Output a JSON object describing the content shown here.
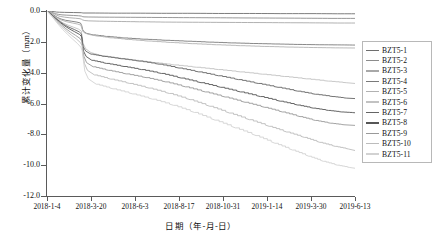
{
  "chart_data": {
    "type": "line",
    "title": "",
    "xlabel": "日期（年-月-日）",
    "ylabel": "累计变化量（mm）",
    "xlim": [
      0,
      7
    ],
    "ylim": [
      -12.0,
      0.0
    ],
    "grid": false,
    "legend_position": "right",
    "xtick_labels": [
      "2018-1-4",
      "2018-3-20",
      "2018-6-3",
      "2018-8-17",
      "2018-10-31",
      "2019-1-14",
      "2019-3-30",
      "2019-6-13"
    ],
    "ytick_labels": [
      "0.0",
      "-2.0",
      "-4.0",
      "-6.0",
      "-8.0",
      "-10.0",
      "-12.0"
    ],
    "ytick_values": [
      0.0,
      -2.0,
      -4.0,
      -6.0,
      -8.0,
      -10.0,
      -12.0
    ],
    "x_unit_note": "x positions are fractional tick index (0 = 2018-1-4, 7 = 2019-6-13)",
    "series": [
      {
        "name": "BZT5-1",
        "color": "#6e6e6e",
        "x": [
          0.0,
          0.1,
          0.18,
          0.22,
          0.28,
          0.4,
          0.6,
          0.78,
          0.8,
          0.82,
          1.0,
          1.5,
          2.0,
          2.6,
          3.2,
          3.9,
          4.6,
          5.3,
          6.0,
          6.6,
          7.0
        ],
        "y": [
          0.0,
          -0.02,
          -0.05,
          -0.07,
          -0.08,
          -0.09,
          -0.1,
          -0.11,
          -0.12,
          -0.13,
          -0.13,
          -0.14,
          -0.14,
          -0.15,
          -0.15,
          -0.16,
          -0.16,
          -0.17,
          -0.17,
          -0.18,
          -0.18
        ]
      },
      {
        "name": "BZT5-2",
        "color": "#8c8c8c",
        "x": [
          0.0,
          0.08,
          0.15,
          0.2,
          0.26,
          0.34,
          0.45,
          0.6,
          0.72,
          0.78,
          0.8,
          0.84,
          0.95,
          1.3,
          1.9,
          2.5,
          3.1,
          3.8,
          4.5,
          5.2,
          5.9,
          6.5,
          7.0
        ],
        "y": [
          0.0,
          -0.05,
          -0.12,
          -0.18,
          -0.22,
          -0.25,
          -0.27,
          -0.29,
          -0.31,
          -0.33,
          -0.36,
          -0.38,
          -0.39,
          -0.4,
          -0.41,
          -0.42,
          -0.43,
          -0.44,
          -0.45,
          -0.46,
          -0.47,
          -0.48,
          -0.48
        ]
      },
      {
        "name": "BZT5-3",
        "color": "#a8a8a8",
        "x": [
          0.0,
          0.08,
          0.16,
          0.22,
          0.3,
          0.4,
          0.52,
          0.65,
          0.75,
          0.79,
          0.81,
          0.86,
          0.95,
          1.2,
          1.6,
          2.1,
          2.7,
          3.3,
          4.0,
          4.7,
          5.4,
          6.1,
          6.6,
          7.0
        ],
        "y": [
          0.0,
          -0.08,
          -0.18,
          -0.28,
          -0.35,
          -0.4,
          -0.44,
          -0.47,
          -0.5,
          -0.54,
          -0.58,
          -0.62,
          -0.64,
          -0.66,
          -0.68,
          -0.7,
          -0.72,
          -0.73,
          -0.74,
          -0.75,
          -0.76,
          -0.77,
          -0.78,
          -0.78
        ]
      },
      {
        "name": "BZT5-4",
        "color": "#7a7a7a",
        "x": [
          0.0,
          0.08,
          0.16,
          0.24,
          0.32,
          0.42,
          0.55,
          0.68,
          0.76,
          0.79,
          0.81,
          0.84,
          0.9,
          1.05,
          1.35,
          1.75,
          2.2,
          2.7,
          3.2,
          3.7,
          4.2,
          4.7,
          5.2,
          5.7,
          6.2,
          6.7,
          7.0
        ],
        "y": [
          0.0,
          -0.12,
          -0.28,
          -0.42,
          -0.52,
          -0.6,
          -0.66,
          -0.72,
          -0.78,
          -0.95,
          -1.2,
          -1.35,
          -1.45,
          -1.55,
          -1.65,
          -1.75,
          -1.83,
          -1.9,
          -1.96,
          -2.02,
          -2.07,
          -2.11,
          -2.14,
          -2.17,
          -2.19,
          -2.2,
          -2.21
        ]
      },
      {
        "name": "BZT5-5",
        "color": "#b2b2b2",
        "x": [
          0.0,
          0.08,
          0.16,
          0.24,
          0.34,
          0.45,
          0.58,
          0.7,
          0.77,
          0.79,
          0.81,
          0.85,
          0.95,
          1.15,
          1.45,
          1.85,
          2.3,
          2.8,
          3.3,
          3.85,
          4.4,
          4.95,
          5.5,
          6.05,
          6.55,
          7.0
        ],
        "y": [
          0.0,
          -0.15,
          -0.33,
          -0.48,
          -0.6,
          -0.7,
          -0.78,
          -0.85,
          -0.92,
          -1.1,
          -1.3,
          -1.42,
          -1.52,
          -1.63,
          -1.74,
          -1.85,
          -1.95,
          -2.04,
          -2.12,
          -2.19,
          -2.25,
          -2.3,
          -2.34,
          -2.37,
          -2.39,
          -2.4
        ]
      },
      {
        "name": "BZT5-6",
        "color": "#c2c2c2",
        "x": [
          0.0,
          0.09,
          0.18,
          0.27,
          0.37,
          0.48,
          0.6,
          0.72,
          0.78,
          0.8,
          0.82,
          0.88,
          1.0,
          1.25,
          1.6,
          2.0,
          2.45,
          2.9,
          3.4,
          3.9,
          4.4,
          4.9,
          5.4,
          5.9,
          6.4,
          6.8,
          7.0
        ],
        "y": [
          0.0,
          -0.18,
          -0.4,
          -0.6,
          -0.78,
          -0.92,
          -1.05,
          -1.18,
          -1.3,
          -1.7,
          -2.1,
          -2.45,
          -2.7,
          -2.9,
          -3.05,
          -3.2,
          -3.35,
          -3.5,
          -3.65,
          -3.8,
          -3.95,
          -4.1,
          -4.25,
          -4.4,
          -4.55,
          -4.65,
          -4.7
        ]
      },
      {
        "name": "BZT5-7",
        "color": "#646464",
        "x": [
          0.0,
          0.09,
          0.19,
          0.29,
          0.39,
          0.5,
          0.62,
          0.73,
          0.78,
          0.8,
          0.82,
          0.88,
          1.0,
          1.3,
          1.7,
          2.1,
          2.55,
          3.0,
          3.45,
          3.9,
          4.35,
          4.8,
          5.25,
          5.7,
          6.1,
          6.5,
          6.8,
          7.0
        ],
        "y": [
          0.0,
          -0.2,
          -0.45,
          -0.68,
          -0.88,
          -1.05,
          -1.2,
          -1.35,
          -1.48,
          -1.9,
          -2.3,
          -2.6,
          -2.8,
          -2.95,
          -3.1,
          -3.25,
          -3.45,
          -3.7,
          -3.95,
          -4.2,
          -4.45,
          -4.7,
          -4.95,
          -5.2,
          -5.4,
          -5.55,
          -5.65,
          -5.68
        ]
      },
      {
        "name": "BZT5-8",
        "color": "#565656",
        "x": [
          0.0,
          0.1,
          0.2,
          0.3,
          0.41,
          0.52,
          0.63,
          0.74,
          0.79,
          0.81,
          0.83,
          0.89,
          1.02,
          1.35,
          1.75,
          2.15,
          2.6,
          3.05,
          3.5,
          3.95,
          4.4,
          4.85,
          5.3,
          5.7,
          6.05,
          6.4,
          6.7,
          7.0
        ],
        "y": [
          0.0,
          -0.22,
          -0.5,
          -0.75,
          -0.98,
          -1.18,
          -1.35,
          -1.52,
          -1.68,
          -2.15,
          -2.6,
          -2.95,
          -3.2,
          -3.4,
          -3.6,
          -3.8,
          -4.05,
          -4.35,
          -4.65,
          -4.95,
          -5.25,
          -5.55,
          -5.85,
          -6.1,
          -6.3,
          -6.45,
          -6.55,
          -6.6
        ]
      },
      {
        "name": "BZT5-9",
        "color": "#9a9a9a",
        "x": [
          0.0,
          0.1,
          0.21,
          0.32,
          0.43,
          0.54,
          0.65,
          0.75,
          0.79,
          0.81,
          0.84,
          0.9,
          1.05,
          1.4,
          1.8,
          2.25,
          2.7,
          3.15,
          3.6,
          4.05,
          4.5,
          4.95,
          5.35,
          5.75,
          6.1,
          6.45,
          6.75,
          7.0
        ],
        "y": [
          0.0,
          -0.25,
          -0.58,
          -0.88,
          -1.15,
          -1.38,
          -1.58,
          -1.78,
          -1.95,
          -2.45,
          -2.95,
          -3.35,
          -3.62,
          -3.85,
          -4.08,
          -4.32,
          -4.6,
          -4.92,
          -5.25,
          -5.58,
          -5.92,
          -6.25,
          -6.55,
          -6.85,
          -7.1,
          -7.28,
          -7.38,
          -7.42
        ]
      },
      {
        "name": "BZT5-10",
        "color": "#bcbcbc",
        "x": [
          0.0,
          0.1,
          0.22,
          0.34,
          0.45,
          0.56,
          0.67,
          0.76,
          0.8,
          0.82,
          0.85,
          0.92,
          1.08,
          1.45,
          1.88,
          2.32,
          2.78,
          3.25,
          3.7,
          4.15,
          4.6,
          5.05,
          5.45,
          5.85,
          6.2,
          6.55,
          6.85,
          7.0
        ],
        "y": [
          0.0,
          -0.3,
          -0.68,
          -1.02,
          -1.32,
          -1.58,
          -1.82,
          -2.05,
          -2.25,
          -2.85,
          -3.4,
          -3.85,
          -4.15,
          -4.42,
          -4.7,
          -5.0,
          -5.35,
          -5.75,
          -6.18,
          -6.62,
          -7.05,
          -7.48,
          -7.85,
          -8.2,
          -8.52,
          -8.78,
          -8.95,
          -9.05
        ]
      },
      {
        "name": "BZT5-11",
        "color": "#d2d2d2",
        "x": [
          0.0,
          0.11,
          0.23,
          0.35,
          0.47,
          0.58,
          0.69,
          0.77,
          0.8,
          0.83,
          0.86,
          0.94,
          1.12,
          1.5,
          1.95,
          2.4,
          2.88,
          3.35,
          3.82,
          4.28,
          4.75,
          5.18,
          5.58,
          5.95,
          6.28,
          6.6,
          6.88,
          7.0
        ],
        "y": [
          0.0,
          -0.34,
          -0.78,
          -1.18,
          -1.52,
          -1.82,
          -2.1,
          -2.35,
          -2.58,
          -3.25,
          -3.9,
          -4.4,
          -4.75,
          -5.05,
          -5.38,
          -5.72,
          -6.12,
          -6.58,
          -7.08,
          -7.58,
          -8.08,
          -8.58,
          -9.02,
          -9.42,
          -9.75,
          -10.0,
          -10.15,
          -10.2
        ]
      }
    ]
  },
  "legend": {
    "items": [
      {
        "label": "BZT5-1"
      },
      {
        "label": "BZT5-2"
      },
      {
        "label": "BZT5-3"
      },
      {
        "label": "BZT5-4"
      },
      {
        "label": "BZT5-5"
      },
      {
        "label": "BZT5-6"
      },
      {
        "label": "BZT5-7"
      },
      {
        "label": "BZT5-8"
      },
      {
        "label": "BZT5-9"
      },
      {
        "label": "BZT5-10"
      },
      {
        "label": "BZT5-11"
      }
    ]
  }
}
